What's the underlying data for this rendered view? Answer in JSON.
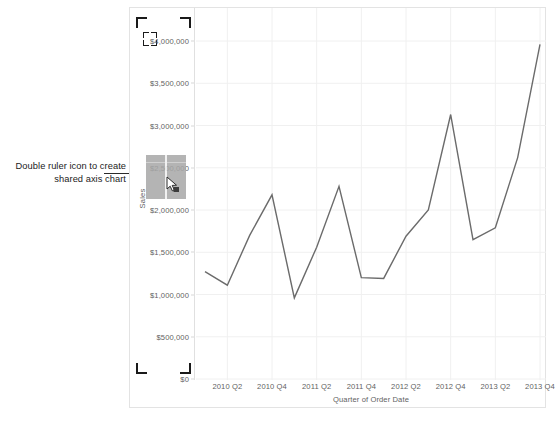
{
  "annotation": {
    "text": "Double ruler icon to create shared axis chart",
    "arrow": "arrow-right"
  },
  "chart": {
    "y_axis_title": "Sales",
    "x_axis_title": "Quarter of Order Date",
    "line_color": "#6b6b6b",
    "grid_color": "#f0f0f0",
    "frame_color": "#e3e3e3"
  },
  "icons": {
    "double_ruler": "double-ruler-icon",
    "cursor": "cursor-pointer-icon",
    "crop": "crop-marker-icon"
  },
  "chart_data": {
    "type": "line",
    "title": "",
    "xlabel": "Quarter of Order Date",
    "ylabel": "Sales",
    "ylim": [
      0,
      4000000
    ],
    "yticks": [
      0,
      500000,
      1000000,
      1500000,
      2000000,
      2500000,
      3000000,
      3500000,
      4000000
    ],
    "ytick_labels": [
      "$0",
      "$500,000",
      "$1,000,000",
      "$1,500,000",
      "$2,000,000",
      "$2,500,000",
      "$3,000,000",
      "$3,500,000",
      "$4,000,000"
    ],
    "grid": true,
    "legend": "none",
    "x_tick_labels": [
      "2010 Q2",
      "2010 Q4",
      "2011 Q2",
      "2011 Q4",
      "2012 Q2",
      "2012 Q4",
      "2013 Q2",
      "2013 Q4"
    ],
    "categories": [
      "2010 Q1",
      "2010 Q2",
      "2010 Q3",
      "2010 Q4",
      "2011 Q1",
      "2011 Q2",
      "2011 Q3",
      "2011 Q4",
      "2012 Q1",
      "2012 Q2",
      "2012 Q3",
      "2012 Q4",
      "2013 Q1",
      "2013 Q2",
      "2013 Q3",
      "2013 Q4"
    ],
    "values": [
      1270000,
      1110000,
      1700000,
      2180000,
      960000,
      1560000,
      2280000,
      1200000,
      1190000,
      1690000,
      2000000,
      3130000,
      1650000,
      1790000,
      2620000,
      3960000
    ],
    "series": [
      {
        "name": "Sales",
        "values": [
          1270000,
          1110000,
          1700000,
          2180000,
          960000,
          1560000,
          2280000,
          1200000,
          1190000,
          1690000,
          2000000,
          3130000,
          1650000,
          1790000,
          2620000,
          3960000
        ]
      }
    ]
  }
}
